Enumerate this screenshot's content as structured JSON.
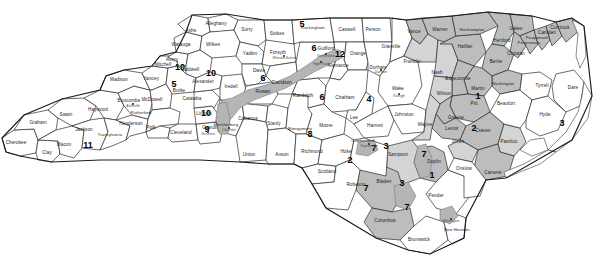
{
  "map": {
    "title": "North Carolina Congressional Districts",
    "background_color": "#ffffff",
    "outline_color": "#1a1a1a",
    "shade_dark": "#a8a8a8",
    "shade_mid": "#bdbdbd",
    "shade_light": "#d4d4d4"
  },
  "districts": [
    {
      "number": "1",
      "x": 478,
      "y": 96,
      "label": "1"
    },
    {
      "number": "2",
      "x": 474,
      "y": 128,
      "label": "2"
    },
    {
      "number": "3",
      "x": 562,
      "y": 123,
      "label": "3"
    },
    {
      "number": "4",
      "x": 369,
      "y": 99,
      "label": "4"
    },
    {
      "number": "5",
      "x": 302,
      "y": 24,
      "label": "5"
    },
    {
      "number": "6",
      "x": 314,
      "y": 48,
      "label": "6"
    },
    {
      "number": "7",
      "x": 374,
      "y": 148,
      "label": "7"
    },
    {
      "number": "8",
      "x": 310,
      "y": 134,
      "label": "8"
    },
    {
      "number": "9",
      "x": 207,
      "y": 129,
      "label": "9"
    },
    {
      "number": "10",
      "x": 180,
      "y": 67,
      "label": "10"
    },
    {
      "number": "11",
      "x": 88,
      "y": 145,
      "label": "11"
    },
    {
      "number": "12",
      "x": 340,
      "y": 54,
      "label": "12"
    },
    {
      "number": "5b",
      "x": 174,
      "y": 84,
      "label": "5"
    },
    {
      "number": "6b",
      "x": 263,
      "y": 78,
      "label": "6"
    },
    {
      "number": "6c",
      "x": 322,
      "y": 97,
      "label": "6"
    },
    {
      "number": "10b",
      "x": 211,
      "y": 73,
      "label": "10"
    },
    {
      "number": "10c",
      "x": 206,
      "y": 113,
      "label": "10"
    },
    {
      "number": "1b",
      "x": 432,
      "y": 175,
      "label": "1"
    },
    {
      "number": "3b",
      "x": 402,
      "y": 183,
      "label": "3"
    },
    {
      "number": "3c",
      "x": 386,
      "y": 146,
      "label": "3"
    },
    {
      "number": "7b",
      "x": 407,
      "y": 207,
      "label": "7"
    },
    {
      "number": "7c",
      "x": 366,
      "y": 188,
      "label": "7"
    },
    {
      "number": "7d",
      "x": 424,
      "y": 154,
      "label": "7"
    },
    {
      "number": "2b",
      "x": 350,
      "y": 160,
      "label": "2"
    }
  ],
  "counties": [
    {
      "name": "Cherokee",
      "x": 16,
      "y": 143
    },
    {
      "name": "Clay",
      "x": 47,
      "y": 153
    },
    {
      "name": "Graham",
      "x": 38,
      "y": 123
    },
    {
      "name": "Swain",
      "x": 66,
      "y": 115
    },
    {
      "name": "Macon",
      "x": 64,
      "y": 145
    },
    {
      "name": "Jackson",
      "x": 84,
      "y": 130
    },
    {
      "name": "Haywood",
      "x": 98,
      "y": 110
    },
    {
      "name": "Transylvania",
      "x": 110,
      "y": 135
    },
    {
      "name": "Henderson",
      "x": 131,
      "y": 124
    },
    {
      "name": "Buncombe",
      "x": 129,
      "y": 101
    },
    {
      "name": "Madison",
      "x": 119,
      "y": 80
    },
    {
      "name": "Yancey",
      "x": 151,
      "y": 79
    },
    {
      "name": "Mitchell",
      "x": 163,
      "y": 65
    },
    {
      "name": "Avery",
      "x": 172,
      "y": 60
    },
    {
      "name": "Watauga",
      "x": 181,
      "y": 45
    },
    {
      "name": "Ashe",
      "x": 191,
      "y": 31
    },
    {
      "name": "Alleghany",
      "x": 216,
      "y": 24
    },
    {
      "name": "Wilkes",
      "x": 213,
      "y": 45
    },
    {
      "name": "Surry",
      "x": 247,
      "y": 30
    },
    {
      "name": "Yadkin",
      "x": 250,
      "y": 54
    },
    {
      "name": "Stokes",
      "x": 277,
      "y": 34
    },
    {
      "name": "Forsyth",
      "x": 278,
      "y": 53
    },
    {
      "name": "Caldwell",
      "x": 190,
      "y": 70
    },
    {
      "name": "Burke",
      "x": 179,
      "y": 91
    },
    {
      "name": "McDowell",
      "x": 152,
      "y": 100
    },
    {
      "name": "Rutherford",
      "x": 141,
      "y": 113
    },
    {
      "name": "Polk",
      "x": 151,
      "y": 128
    },
    {
      "name": "Cleveland",
      "x": 181,
      "y": 133
    },
    {
      "name": "Gaston",
      "x": 210,
      "y": 128
    },
    {
      "name": "Lincoln",
      "x": 204,
      "y": 114
    },
    {
      "name": "Catawba",
      "x": 192,
      "y": 99
    },
    {
      "name": "Alexander",
      "x": 203,
      "y": 82
    },
    {
      "name": "Iredell",
      "x": 231,
      "y": 87
    },
    {
      "name": "Davie",
      "x": 259,
      "y": 71
    },
    {
      "name": "Rowan",
      "x": 263,
      "y": 92
    },
    {
      "name": "Davidson",
      "x": 282,
      "y": 83
    },
    {
      "name": "Mecklenburg",
      "x": 226,
      "y": 125
    },
    {
      "name": "Cabarrus",
      "x": 248,
      "y": 119
    },
    {
      "name": "Stanly",
      "x": 274,
      "y": 124
    },
    {
      "name": "Union",
      "x": 249,
      "y": 155
    },
    {
      "name": "Anson",
      "x": 282,
      "y": 155
    },
    {
      "name": "Montgomery",
      "x": 300,
      "y": 129
    },
    {
      "name": "Randolph",
      "x": 303,
      "y": 96
    },
    {
      "name": "Guilford",
      "x": 326,
      "y": 49
    },
    {
      "name": "Rockingham",
      "x": 313,
      "y": 28
    },
    {
      "name": "Caswell",
      "x": 347,
      "y": 30
    },
    {
      "name": "Person",
      "x": 373,
      "y": 30
    },
    {
      "name": "Orange",
      "x": 358,
      "y": 54
    },
    {
      "name": "Alamance",
      "x": 338,
      "y": 66
    },
    {
      "name": "Chatham",
      "x": 345,
      "y": 98
    },
    {
      "name": "Durham",
      "x": 378,
      "y": 68
    },
    {
      "name": "Granville",
      "x": 391,
      "y": 47
    },
    {
      "name": "Vance",
      "x": 414,
      "y": 32
    },
    {
      "name": "Warren",
      "x": 440,
      "y": 30
    },
    {
      "name": "Franklin",
      "x": 412,
      "y": 62
    },
    {
      "name": "Nash",
      "x": 437,
      "y": 73
    },
    {
      "name": "Halifax",
      "x": 465,
      "y": 47
    },
    {
      "name": "Northampton",
      "x": 472,
      "y": 30
    },
    {
      "name": "Hertford",
      "x": 502,
      "y": 41
    },
    {
      "name": "Gates",
      "x": 516,
      "y": 29
    },
    {
      "name": "Bertie",
      "x": 496,
      "y": 62
    },
    {
      "name": "Chowan",
      "x": 516,
      "y": 54
    },
    {
      "name": "Perquimans",
      "x": 529,
      "y": 43
    },
    {
      "name": "Pasquotank",
      "x": 537,
      "y": 38
    },
    {
      "name": "Camden",
      "x": 547,
      "y": 33
    },
    {
      "name": "Currituck",
      "x": 560,
      "y": 28
    },
    {
      "name": "Washington",
      "x": 503,
      "y": 84
    },
    {
      "name": "Tyrrell",
      "x": 542,
      "y": 86
    },
    {
      "name": "Dare",
      "x": 573,
      "y": 88
    },
    {
      "name": "Hyde",
      "x": 545,
      "y": 115
    },
    {
      "name": "Beaufort",
      "x": 506,
      "y": 104
    },
    {
      "name": "Martin",
      "x": 478,
      "y": 89
    },
    {
      "name": "Edgecombe",
      "x": 458,
      "y": 79
    },
    {
      "name": "Wilson",
      "x": 444,
      "y": 94
    },
    {
      "name": "Pitt",
      "x": 474,
      "y": 104
    },
    {
      "name": "Greene",
      "x": 456,
      "y": 118
    },
    {
      "name": "Lenoir",
      "x": 452,
      "y": 129
    },
    {
      "name": "Wayne",
      "x": 425,
      "y": 125
    },
    {
      "name": "Johnston",
      "x": 404,
      "y": 115
    },
    {
      "name": "Wake",
      "x": 398,
      "y": 89
    },
    {
      "name": "Harnett",
      "x": 375,
      "y": 126
    },
    {
      "name": "Lee",
      "x": 354,
      "y": 118
    },
    {
      "name": "Moore",
      "x": 326,
      "y": 126
    },
    {
      "name": "Richmond",
      "x": 312,
      "y": 152
    },
    {
      "name": "Scotland",
      "x": 327,
      "y": 172
    },
    {
      "name": "Hoke",
      "x": 346,
      "y": 152
    },
    {
      "name": "Cumberland",
      "x": 363,
      "y": 141
    },
    {
      "name": "Sampson",
      "x": 398,
      "y": 155
    },
    {
      "name": "Duplin",
      "x": 434,
      "y": 162
    },
    {
      "name": "Jones",
      "x": 458,
      "y": 142
    },
    {
      "name": "Craven",
      "x": 483,
      "y": 131
    },
    {
      "name": "Pamlico",
      "x": 509,
      "y": 142
    },
    {
      "name": "Carteret",
      "x": 493,
      "y": 173
    },
    {
      "name": "Onslow",
      "x": 464,
      "y": 169
    },
    {
      "name": "Pender",
      "x": 436,
      "y": 196
    },
    {
      "name": "Bladen",
      "x": 384,
      "y": 182
    },
    {
      "name": "Robeson",
      "x": 356,
      "y": 185
    },
    {
      "name": "Columbus",
      "x": 385,
      "y": 221
    },
    {
      "name": "Brunswick",
      "x": 419,
      "y": 240
    },
    {
      "name": "New Hanover",
      "x": 457,
      "y": 230
    }
  ],
  "cities": [
    {
      "name": "Asheville",
      "x": 133,
      "y": 107
    },
    {
      "name": "Winston-Salem",
      "x": 284,
      "y": 59
    },
    {
      "name": "Greensboro",
      "x": 326,
      "y": 57
    },
    {
      "name": "High Point",
      "x": 321,
      "y": 65
    },
    {
      "name": "Charlotte",
      "x": 229,
      "y": 131
    },
    {
      "name": "Gastonia",
      "x": 208,
      "y": 135
    },
    {
      "name": "Raleigh",
      "x": 399,
      "y": 97
    },
    {
      "name": "Durham",
      "x": 381,
      "y": 73
    },
    {
      "name": "Fayetteville",
      "x": 369,
      "y": 147
    },
    {
      "name": "Wilmington",
      "x": 451,
      "y": 222
    }
  ]
}
